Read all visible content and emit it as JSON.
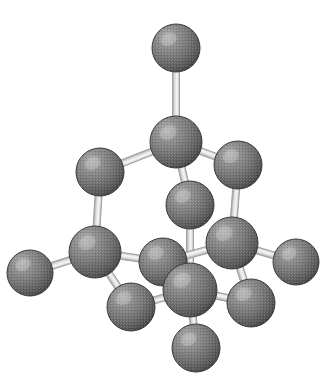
{
  "figure": {
    "caption": "",
    "background_color": "#ffffff",
    "canvas": {
      "width": 333,
      "height": 384
    }
  },
  "style": {
    "atom_fill_light": "#9a9a9a",
    "atom_fill_mid": "#7b7b7b",
    "atom_fill_dark": "#4e4e4e",
    "atom_edge_color": "#3a3a3a",
    "atom_highlight_color": "#c9c9c9",
    "bond_fill_color": "#e3e3e3",
    "bond_core_color": "#f2f2f2",
    "bond_edge_color": "#9e9e9e",
    "bond_width": 7
  },
  "model": {
    "type": "ball-and-stick",
    "atom_count": 14,
    "bond_count": 16,
    "element": "C",
    "atoms": [
      {
        "id": "a1",
        "name": "top-apex-atom",
        "cx": 176,
        "cy": 48,
        "r": 24
      },
      {
        "id": "a2",
        "name": "upper-center-atom",
        "cx": 176,
        "cy": 142,
        "r": 26
      },
      {
        "id": "a3",
        "name": "upper-left-atom",
        "cx": 100,
        "cy": 172,
        "r": 24
      },
      {
        "id": "a4",
        "name": "upper-right-atom",
        "cx": 238,
        "cy": 165,
        "r": 24
      },
      {
        "id": "a5",
        "name": "inner-center-atom",
        "cx": 190,
        "cy": 205,
        "r": 24
      },
      {
        "id": "a6",
        "name": "mid-left-atom",
        "cx": 95,
        "cy": 252,
        "r": 26
      },
      {
        "id": "a7",
        "name": "left-terminal-atom",
        "cx": 30,
        "cy": 273,
        "r": 23
      },
      {
        "id": "a8",
        "name": "mid-inner-left-atom",
        "cx": 163,
        "cy": 262,
        "r": 24
      },
      {
        "id": "a9",
        "name": "mid-right-atom",
        "cx": 232,
        "cy": 243,
        "r": 26
      },
      {
        "id": "a10",
        "name": "right-terminal-atom",
        "cx": 296,
        "cy": 262,
        "r": 23
      },
      {
        "id": "a11",
        "name": "front-center-atom",
        "cx": 190,
        "cy": 290,
        "r": 27
      },
      {
        "id": "a12",
        "name": "lower-left-atom",
        "cx": 131,
        "cy": 307,
        "r": 24
      },
      {
        "id": "a13",
        "name": "lower-right-atom",
        "cx": 251,
        "cy": 303,
        "r": 24
      },
      {
        "id": "a14",
        "name": "bottom-apex-atom",
        "cx": 196,
        "cy": 348,
        "r": 24
      }
    ],
    "bonds": [
      {
        "id": "b1",
        "name": "bond-top-apex-upper-center",
        "from": "a1",
        "to": "a2"
      },
      {
        "id": "b2",
        "name": "bond-upper-center-upper-left",
        "from": "a2",
        "to": "a3"
      },
      {
        "id": "b3",
        "name": "bond-upper-center-upper-right",
        "from": "a2",
        "to": "a4"
      },
      {
        "id": "b4",
        "name": "bond-upper-center-inner-center",
        "from": "a2",
        "to": "a5"
      },
      {
        "id": "b5",
        "name": "bond-upper-left-mid-left",
        "from": "a3",
        "to": "a6"
      },
      {
        "id": "b6",
        "name": "bond-upper-right-mid-right",
        "from": "a4",
        "to": "a9"
      },
      {
        "id": "b7",
        "name": "bond-inner-center-front-center",
        "from": "a5",
        "to": "a11"
      },
      {
        "id": "b8",
        "name": "bond-mid-left-left-terminal",
        "from": "a6",
        "to": "a7"
      },
      {
        "id": "b9",
        "name": "bond-mid-left-mid-inner-left",
        "from": "a6",
        "to": "a8"
      },
      {
        "id": "b10",
        "name": "bond-mid-left-lower-left",
        "from": "a6",
        "to": "a12"
      },
      {
        "id": "b11",
        "name": "bond-mid-inner-left-mid-right",
        "from": "a8",
        "to": "a9"
      },
      {
        "id": "b12",
        "name": "bond-mid-right-right-terminal",
        "from": "a9",
        "to": "a10"
      },
      {
        "id": "b13",
        "name": "bond-mid-right-lower-right",
        "from": "a9",
        "to": "a13"
      },
      {
        "id": "b14",
        "name": "bond-front-center-lower-left",
        "from": "a11",
        "to": "a12"
      },
      {
        "id": "b15",
        "name": "bond-front-center-lower-right",
        "from": "a11",
        "to": "a13"
      },
      {
        "id": "b16",
        "name": "bond-front-center-bottom-apex",
        "from": "a11",
        "to": "a14"
      }
    ]
  }
}
